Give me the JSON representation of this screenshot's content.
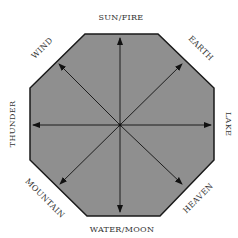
{
  "diagram": {
    "shape": "octagon",
    "fill_color": "#8f8f8f",
    "stroke_color": "#1a1a1a",
    "arrow_color": "#111111",
    "labels": {
      "top": "SUN/FIRE",
      "top_right": "EARTH",
      "right": "LAKE",
      "bottom_right": "HEAVEN",
      "bottom": "WATER/MOON",
      "bottom_left": "MOUNTAIN",
      "left": "THUNDER",
      "top_left": "WIND"
    }
  }
}
